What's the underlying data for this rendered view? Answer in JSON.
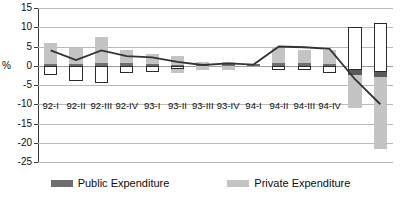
{
  "chart_data": {
    "type": "bar",
    "title": "",
    "subtitle": "",
    "xlabel": "",
    "ylabel": "%",
    "ylim": [
      -25,
      15
    ],
    "ytick_step": 5,
    "yticks": [
      15,
      10,
      5,
      0,
      -5,
      -10,
      -15,
      -20,
      -25
    ],
    "ytick_labels": [
      "15",
      "10",
      "5",
      "0",
      "-5",
      "-10",
      "-15",
      "-20",
      "-25"
    ],
    "grid": true,
    "legend_position": "bottom",
    "categories": [
      "92-I",
      "92-II",
      "92-III",
      "92-IV",
      "93-I",
      "93-II",
      "93-III",
      "93-IV",
      "94-I",
      "94-II",
      "94-III",
      "94-IV"
    ],
    "series": [
      {
        "name": "Public Expenditure",
        "color": "#6e6e6e",
        "positive_values": [
          0.4,
          0.4,
          0.6,
          0.6,
          0.4,
          0.3,
          0.5,
          0.5,
          0.4,
          0.6,
          0.6,
          0.5
        ],
        "negative_values": [
          -2.5,
          -4.0,
          -4.5,
          -2.0,
          -1.5,
          -0.8,
          0.0,
          0.0,
          0.0,
          -1.0,
          -1.0,
          -2.0
        ],
        "values": [
          -2.1,
          -3.6,
          -3.9,
          -1.4,
          -1.1,
          -0.5,
          0.5,
          0.5,
          0.4,
          -0.4,
          -0.4,
          -1.5
        ]
      },
      {
        "name": "Private Expenditure",
        "color": "#c4c4c4",
        "positive_values": [
          6.0,
          4.5,
          7.5,
          4.0,
          3.0,
          2.5,
          1.0,
          1.0,
          0.5,
          5.0,
          4.0,
          4.0
        ],
        "negative_values": [
          0.0,
          0.0,
          0.0,
          0.0,
          0.0,
          -2.0,
          -1.0,
          -1.0,
          0.0,
          0.0,
          0.0,
          0.0
        ],
        "values": [
          6.0,
          4.5,
          7.5,
          4.0,
          3.0,
          0.5,
          0.0,
          0.0,
          0.5,
          5.0,
          4.0,
          4.0
        ]
      }
    ],
    "line_series": {
      "name": "Total",
      "color": "#333333",
      "values": [
        4.0,
        1.5,
        4.0,
        2.5,
        2.2,
        1.0,
        0.2,
        0.6,
        0.3,
        5.0,
        4.8,
        4.4,
        -3.5,
        -10.0
      ]
    },
    "extra_bars": [
      {
        "label": "",
        "public_negative": -11.0,
        "public_dark": -1.0,
        "private_positive": 10.0,
        "private_negative": -11.0
      },
      {
        "label": "",
        "public_negative": -21.5,
        "public_dark": -1.5,
        "private_positive": 11.0,
        "private_negative": -21.5
      }
    ]
  },
  "legend": {
    "items": [
      {
        "label": "Public Expenditure",
        "color": "#6e6e6e"
      },
      {
        "label": "Private Expenditure",
        "color": "#c4c4c4"
      }
    ]
  },
  "axis": {
    "y_title": "%"
  }
}
